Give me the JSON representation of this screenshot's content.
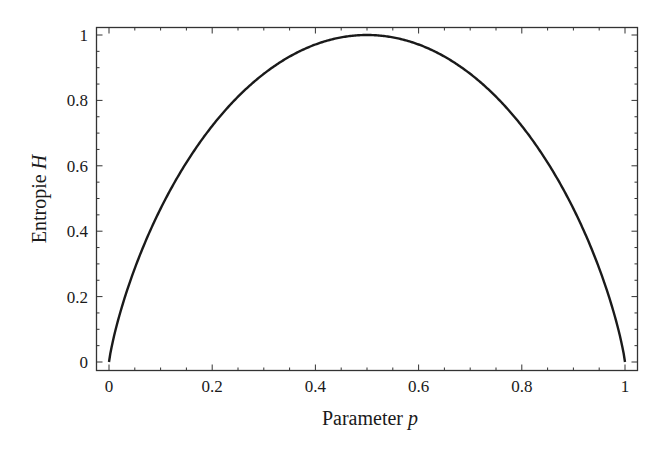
{
  "chart_data": {
    "type": "line",
    "title": "",
    "xlabel": "Parameter",
    "xlabel_var": "p",
    "ylabel": "Entropie",
    "ylabel_var": "H",
    "xlim": [
      0,
      1
    ],
    "ylim": [
      0,
      1
    ],
    "grid": false,
    "legend": null,
    "x_ticks": [
      0,
      0.2,
      0.4,
      0.6,
      0.8,
      1
    ],
    "x_tick_labels": [
      "0",
      "0.2",
      "0.4",
      "0.6",
      "0.8",
      "1"
    ],
    "y_ticks": [
      0,
      0.2,
      0.4,
      0.6,
      0.8,
      1
    ],
    "y_tick_labels": [
      "0",
      "0.2",
      "0.4",
      "0.6",
      "0.8",
      "1"
    ],
    "series": [
      {
        "name": "H(p) = -p log2 p - (1-p) log2(1-p)",
        "x": [
          0,
          0.05,
          0.1,
          0.15,
          0.2,
          0.25,
          0.3,
          0.35,
          0.4,
          0.45,
          0.5,
          0.55,
          0.6,
          0.65,
          0.7,
          0.75,
          0.8,
          0.85,
          0.9,
          0.95,
          1
        ],
        "values": [
          0,
          0.286,
          0.469,
          0.61,
          0.722,
          0.811,
          0.881,
          0.934,
          0.971,
          0.993,
          1.0,
          0.993,
          0.971,
          0.934,
          0.881,
          0.811,
          0.722,
          0.61,
          0.469,
          0.286,
          0
        ],
        "color": "#1a1a1a"
      }
    ]
  }
}
